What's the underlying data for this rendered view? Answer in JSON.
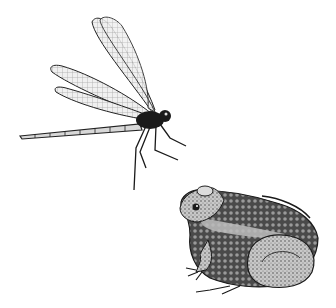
{
  "image": {
    "description": "Pen-and-ink illustration of a dragonfly in flight at upper left and a frog seated at lower right, facing left, on a white background",
    "subjects": [
      "dragonfly",
      "frog"
    ],
    "style": "black and white stippled ink drawing",
    "colors": {
      "background": "#ffffff",
      "ink": "#1a1a1a",
      "wing_fill": "#e8e8e8",
      "frog_light": "#bdbdbd",
      "frog_dark": "#3a3a3a"
    }
  }
}
